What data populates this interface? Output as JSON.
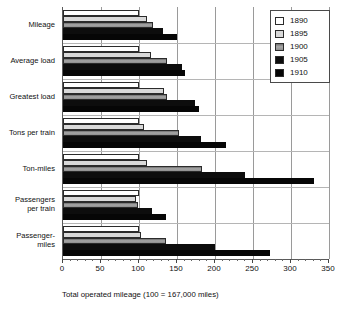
{
  "chart_data": {
    "type": "bar",
    "orientation": "horizontal",
    "title": "",
    "xlabel": "Total operated mileage (100 = 167,000 miles)",
    "ylabel": "",
    "xlim": [
      0,
      350
    ],
    "xticks": [
      0,
      50,
      100,
      150,
      200,
      250,
      300,
      350
    ],
    "xtick_labels": [
      "0",
      "50",
      "100",
      "150",
      "200",
      "250",
      "300",
      "350"
    ],
    "grid": true,
    "grid_axis": "x",
    "legend_position": "top-right inside plot",
    "categories": [
      "Mileage",
      "Average load",
      "Greatest load",
      "Tons per train",
      "Ton-miles",
      "Passengers\nper train",
      "Passenger-\nmiles"
    ],
    "series": [
      {
        "name": "1890",
        "color": "#ffffff",
        "values": [
          100,
          100,
          100,
          100,
          100,
          100,
          100
        ]
      },
      {
        "name": "1895",
        "color": "#d9d9d9",
        "values": [
          110,
          116,
          133,
          107,
          110,
          96,
          103
        ]
      },
      {
        "name": "1900",
        "color": "#8d8d8d",
        "values": [
          118,
          137,
          137,
          152,
          183,
          99,
          135
        ]
      },
      {
        "name": "1905",
        "color": "#0d0d0d",
        "values": [
          131,
          157,
          174,
          181,
          240,
          117,
          200
        ]
      },
      {
        "name": "1910",
        "color": "#060606",
        "values": [
          150,
          161,
          179,
          214,
          330,
          135,
          272
        ]
      }
    ]
  },
  "legend": {
    "entries": [
      {
        "label": "1890"
      },
      {
        "label": "1895"
      },
      {
        "label": "1900"
      },
      {
        "label": "1905"
      },
      {
        "label": "1910"
      }
    ]
  }
}
